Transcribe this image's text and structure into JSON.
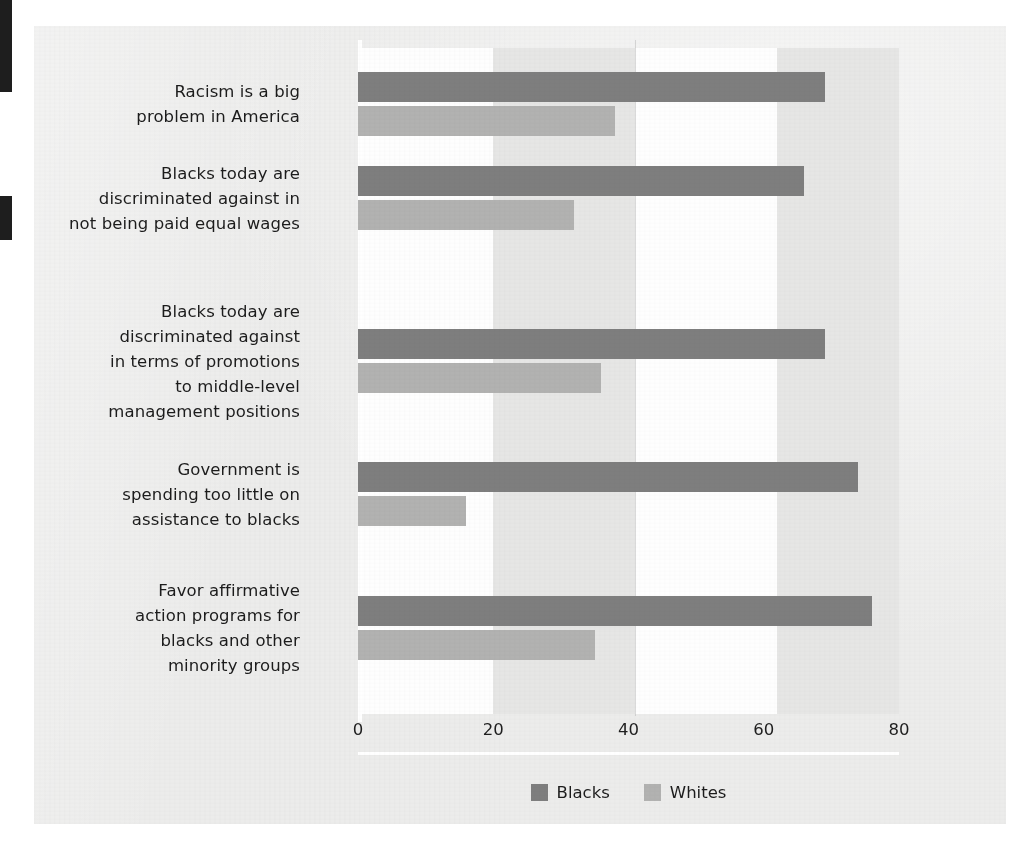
{
  "chart_data": {
    "type": "bar",
    "orientation": "horizontal",
    "title": "",
    "subtitle": "",
    "xlabel": "",
    "ylabel": "",
    "xlim": [
      0,
      80
    ],
    "xticks": [
      "0",
      "20",
      "40",
      "60",
      "80"
    ],
    "grid": "vertical-bands",
    "legend_position": "bottom-center",
    "categories": [
      "Racism is a big\nproblem in America",
      "Blacks today are\ndiscriminated against in\nnot being paid equal wages",
      "Blacks today are\ndiscriminated against\nin terms of promotions\nto middle-level\nmanagement positions",
      "Government is\nspending too little on\nassistance to blacks",
      "Favor affirmative\naction programs for\nblacks and other\nminority groups"
    ],
    "category_lines": [
      [
        "Racism is a big",
        "problem in America"
      ],
      [
        "Blacks today are",
        "discriminated against in",
        "not being paid equal wages"
      ],
      [
        "Blacks today are",
        "discriminated against",
        "in terms of promotions",
        "to middle-level",
        "management positions"
      ],
      [
        "Government is",
        "spending too little on",
        "assistance to blacks"
      ],
      [
        "Favor affirmative",
        "action programs for",
        "blacks and other",
        "minority groups"
      ]
    ],
    "series": [
      {
        "name": "Blacks",
        "color": "#7e7e7e",
        "values": [
          69,
          66,
          69,
          74,
          76
        ]
      },
      {
        "name": "Whites",
        "color": "#b2b2b1",
        "values": [
          38,
          32,
          36,
          16,
          35
        ]
      }
    ]
  },
  "legend": {
    "items": [
      {
        "label": "Blacks",
        "color": "#7e7e7e"
      },
      {
        "label": "Whites",
        "color": "#b2b2b1"
      }
    ]
  },
  "colors": {
    "page_background": "#ffffff",
    "sheet_background": "#ececeb",
    "band_light": "#fefefe",
    "band_grey": "#e6e6e5",
    "axis_line": "#ffffff",
    "text": "#1c1c1c",
    "edge_mark": "#1e1e1e"
  }
}
